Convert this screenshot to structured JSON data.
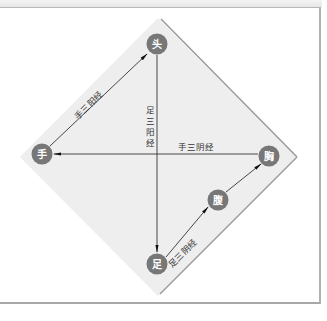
{
  "figure": {
    "type": "diagram",
    "colors": {
      "diamond_fill": "#eeeeee",
      "diamond_border": "#9a9a9a",
      "node_fill": "#777777",
      "node_text": "#ffffff",
      "line": "#333333"
    }
  },
  "nodes": {
    "head": {
      "label": "头",
      "x": 157,
      "y": 44
    },
    "hand": {
      "label": "手",
      "x": 42,
      "y": 153
    },
    "chest": {
      "label": "胸",
      "x": 269,
      "y": 156
    },
    "abdomen": {
      "label": "腹",
      "x": 218,
      "y": 200
    },
    "foot": {
      "label": "足",
      "x": 157,
      "y": 264
    }
  },
  "edges": {
    "hand_to_head": {
      "from": "手",
      "to": "头",
      "label": "手三阳经"
    },
    "head_to_foot": {
      "from": "头",
      "to": "足",
      "label": "足三阳经"
    },
    "chest_to_hand": {
      "from": "胸",
      "to": "手",
      "label": "手三阴经"
    },
    "foot_to_abdomen": {
      "from": "足",
      "to": "腹",
      "label": "足三阴经"
    },
    "abdomen_to_chest": {
      "from": "腹",
      "to": "胸",
      "label": ""
    }
  },
  "vertical_label_chars": [
    "足",
    "三",
    "阳",
    "经"
  ]
}
